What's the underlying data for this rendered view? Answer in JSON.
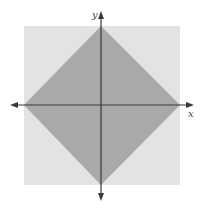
{
  "figure": {
    "axis_labels": {
      "x": "x",
      "y": "y"
    },
    "colors": {
      "background": "#ffffff",
      "square": "#e3e3e3",
      "diamond": "#a9a9a9",
      "axes": "#3a3a3a",
      "label": "#444444"
    },
    "square": {
      "x": 24,
      "y": 26,
      "width": 156,
      "height": 159
    },
    "diamond": {
      "points": "101,26 180,105 101,185 24,105"
    },
    "origin": {
      "x": 101,
      "y": 105
    }
  }
}
